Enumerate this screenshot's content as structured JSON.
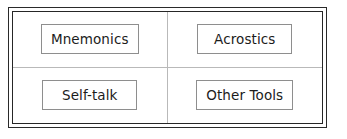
{
  "diagram": {
    "type": "2x2-grid",
    "frame": {
      "style": "double-rule",
      "outer_color": "#2a2a2a",
      "inner_color": "#262626"
    },
    "divider_color": "#b9b9b9",
    "box_border_color": "#8e8e8e",
    "background_color": "#ffffff",
    "text_color": "#1c1c1c",
    "cells": [
      {
        "position": "top-left",
        "label": "Mnemonics"
      },
      {
        "position": "top-right",
        "label": "Acrostics"
      },
      {
        "position": "bottom-left",
        "label": "Self-talk"
      },
      {
        "position": "bottom-right",
        "label": "Other Tools"
      }
    ]
  }
}
